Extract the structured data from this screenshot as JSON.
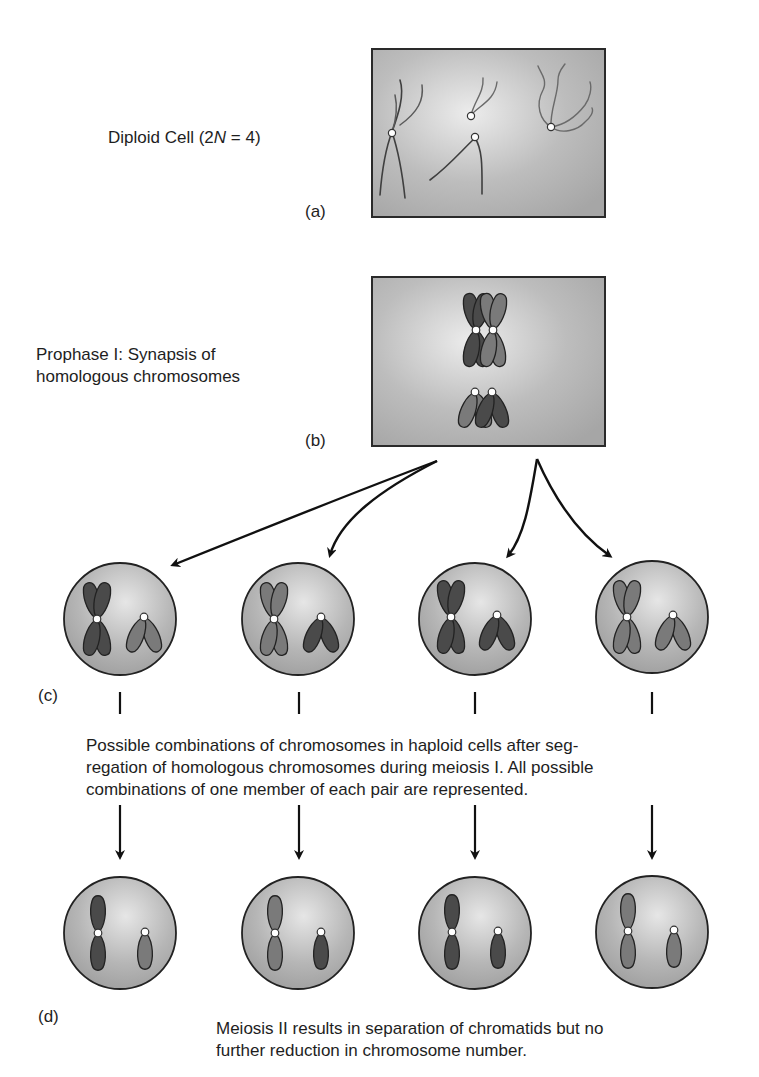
{
  "panels": {
    "a": {
      "letter": "(a)",
      "label_pre": "Diploid Cell (2",
      "label_italic": "N",
      "label_post": " = 4)"
    },
    "b": {
      "letter": "(b)",
      "label_line1": "Prophase I: Synapsis of",
      "label_line2": "homologous chromosomes"
    },
    "c": {
      "letter": "(c)",
      "caption_line1": "Possible combinations of chromosomes in haploid cells after seg-",
      "caption_line2": "regation of homologous chromosomes during meiosis I. All possible",
      "caption_line3": "combinations of one member of each pair are represented.",
      "cells": [
        {
          "large_pair_shade": "dark",
          "small_pair_shade": "light"
        },
        {
          "large_pair_shade": "light",
          "small_pair_shade": "dark"
        },
        {
          "large_pair_shade": "dark",
          "small_pair_shade": "dark"
        },
        {
          "large_pair_shade": "light",
          "small_pair_shade": "light"
        }
      ]
    },
    "d": {
      "letter": "(d)",
      "caption_line1": "Meiosis II results in separation of chromatids but no",
      "caption_line2": "further reduction in chromosome number.",
      "cells": [
        {
          "large_shade": "dark",
          "small_shade": "light"
        },
        {
          "large_shade": "light",
          "small_shade": "dark"
        },
        {
          "large_shade": "dark",
          "small_shade": "dark"
        },
        {
          "large_shade": "light",
          "small_shade": "light"
        }
      ]
    }
  },
  "colors": {
    "background": "#ffffff",
    "box_fill_center": "#e8e8e8",
    "box_fill_edge": "#a8a8a8",
    "outline": "#222222",
    "chromosome_dark": "#4a4a4a",
    "chromosome_light": "#7c7c7c",
    "centromere": "#ffffff",
    "arrow": "#111111"
  }
}
